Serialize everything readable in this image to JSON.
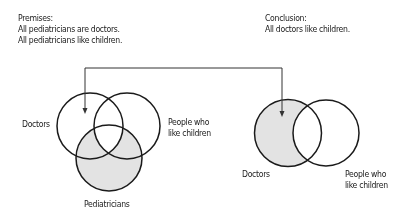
{
  "premises": {
    "heading": "Premises:",
    "lines": [
      "All pediatricians are doctors.",
      "All pediatricians like children."
    ]
  },
  "conclusion": {
    "heading": "Conclusion:",
    "lines": [
      "All doctors like children."
    ]
  },
  "left_diagram": {
    "labels": {
      "doctors": "Doctors",
      "people_line1": "People who",
      "people_line2": "like children",
      "pediatricians": "Pediatricians"
    },
    "shaded_region": "Pediatricians outside the triple overlap"
  },
  "right_diagram": {
    "labels": {
      "doctors": "Doctors",
      "people_line1": "People who",
      "people_line2": "like children"
    },
    "shaded_region": "Doctors outside People who like children"
  },
  "colors": {
    "stroke": "#1a1a1a",
    "shade": "#e3e3e3",
    "background": "#ffffff"
  }
}
